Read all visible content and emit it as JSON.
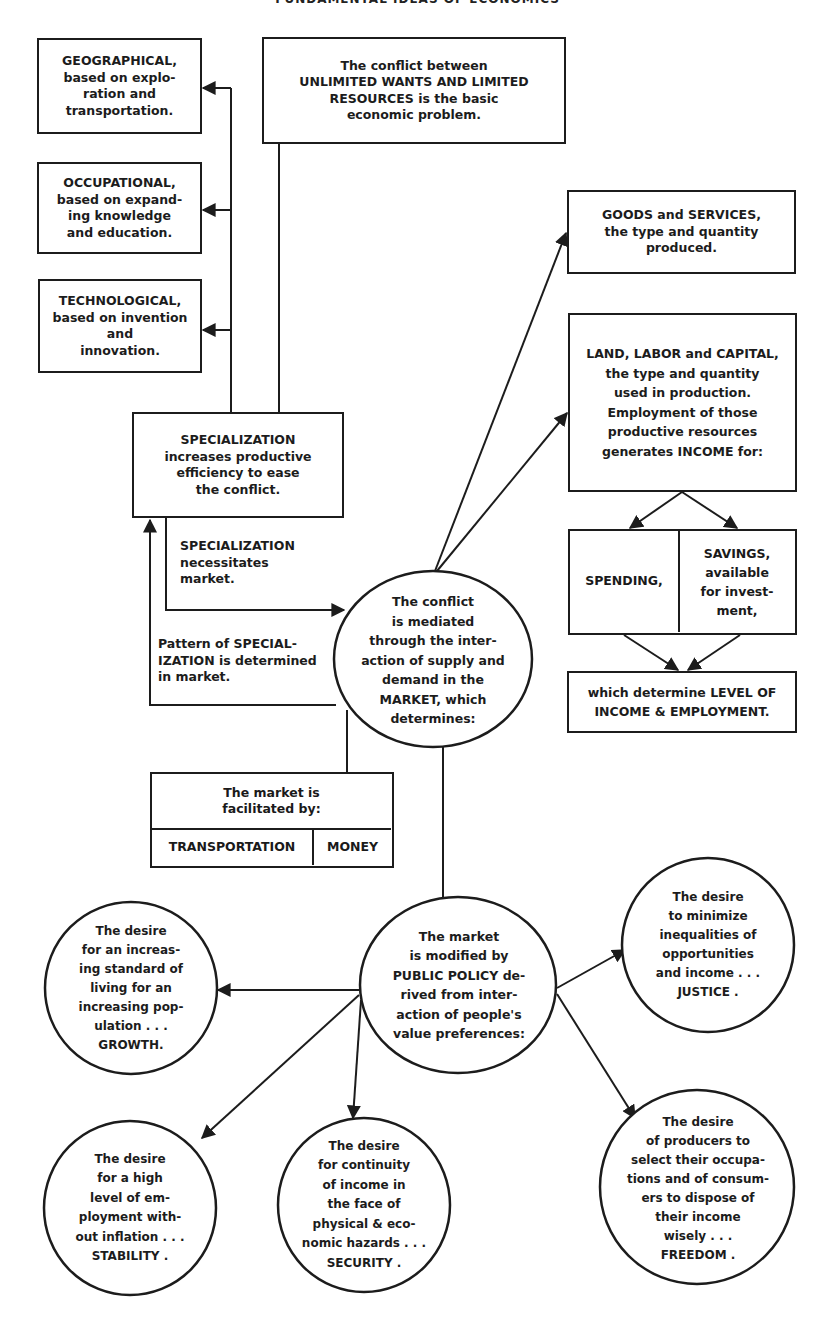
{
  "title": "FUNDAMENTAL IDEAS OF ECONOMICS",
  "colors": {
    "ink": "#1c1c1c",
    "paper": "#ffffff"
  },
  "boxes": {
    "geographical": "GEOGRAPHICAL,\nbased on explo-\nration and\ntransportation.",
    "occupational": "OCCUPATIONAL,\nbased on expand-\ning knowledge\nand education.",
    "technological": "TECHNOLOGICAL,\nbased on invention\nand\ninnovation.",
    "basic_problem": "The conflict between\nUNLIMITED WANTS AND LIMITED\nRESOURCES is the basic\neconomic problem.",
    "specialization": "SPECIALIZATION\nincreases productive\nefficiency to ease\nthe conflict.",
    "goods_services": "GOODS and SERVICES,\nthe type and quantity\nproduced.",
    "land_labor_capital": "LAND, LABOR and CAPITAL,\nthe type and quantity\nused in production.\nEmployment of those\nproductive resources\ngenerates INCOME for:",
    "spending": "SPENDING,",
    "savings": "SAVINGS,\navailable\nfor invest-\nment,",
    "level_income": "which determine LEVEL OF\nINCOME & EMPLOYMENT.",
    "facilitated_header": "The market is\nfacilitated by:",
    "transportation": "TRANSPORTATION",
    "money": "MONEY"
  },
  "labels": {
    "necessitates_market": "SPECIALIZATION\nnecessitates\nmarket.",
    "pattern_determined": "Pattern of SPECIAL-\nIZATION is determined\nin market."
  },
  "circles": {
    "market": "The conflict\nis mediated\nthrough the inter-\naction of supply and\ndemand in the\nMARKET, which\ndetermines:",
    "public_policy": "The market\nis modified by\nPUBLIC POLICY de-\nrived from inter-\naction of people's\nvalue preferences:",
    "growth": "The desire\nfor an increas-\ning standard of\nliving for an\nincreasing pop-\nulation . . .\nGROWTH.",
    "justice": "The desire\nto minimize\ninequalities of\nopportunities\nand income . . .\nJUSTICE .",
    "stability": "The desire\nfor a high\nlevel of em-\nployment with-\nout inflation . . .\nSTABILITY .",
    "security": "The desire\nfor continuity\nof income in\nthe face of\nphysical & eco-\nnomic hazards . . .\nSECURITY .",
    "freedom": "The desire\nof producers to\nselect their occupa-\ntions and of consum-\ners to dispose of\ntheir income\nwisely . . .\nFREEDOM ."
  }
}
